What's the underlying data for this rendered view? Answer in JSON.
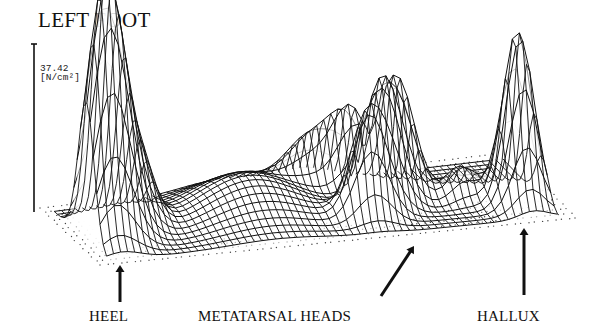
{
  "title": "LEFT FOOT",
  "axis": {
    "max_value": "37.42",
    "unit": "[N/cm²]"
  },
  "labels": {
    "heel": "HEEL",
    "metatarsal": "METATARSAL HEADS",
    "hallux": "HALLUX"
  },
  "chart_data": {
    "type": "surface-3d-wireframe",
    "title": "LEFT FOOT",
    "zlabel": "[N/cm²]",
    "zmax": 37.42,
    "grid": {
      "nu": 64,
      "nv": 16
    },
    "base_plane": {
      "back_left": [
        40,
        208
      ],
      "front_left": [
        100,
        265
      ],
      "front_right": [
        575,
        218
      ],
      "back_right": [
        512,
        152
      ]
    },
    "height_scale_px": 178,
    "peaks": [
      {
        "name": "heel-1",
        "u": 0.05,
        "v": 0.62,
        "amp": 1.0,
        "su": 0.035,
        "sv": 0.13
      },
      {
        "name": "heel-2",
        "u": 0.09,
        "v": 0.55,
        "amp": 0.8,
        "su": 0.035,
        "sv": 0.13
      },
      {
        "name": "heel-3",
        "u": 0.15,
        "v": 0.45,
        "amp": 0.35,
        "su": 0.03,
        "sv": 0.12
      },
      {
        "name": "midfoot",
        "u": 0.38,
        "v": 0.45,
        "amp": 0.22,
        "su": 0.1,
        "sv": 0.25
      },
      {
        "name": "mt-1",
        "u": 0.6,
        "v": 0.72,
        "amp": 0.55,
        "su": 0.035,
        "sv": 0.08
      },
      {
        "name": "mt-2",
        "u": 0.65,
        "v": 0.58,
        "amp": 0.65,
        "su": 0.035,
        "sv": 0.08
      },
      {
        "name": "mt-3",
        "u": 0.7,
        "v": 0.44,
        "amp": 0.62,
        "su": 0.035,
        "sv": 0.08
      },
      {
        "name": "mt-4",
        "u": 0.62,
        "v": 0.3,
        "amp": 0.4,
        "su": 0.035,
        "sv": 0.08
      },
      {
        "name": "mt-5",
        "u": 0.55,
        "v": 0.22,
        "amp": 0.3,
        "su": 0.05,
        "sv": 0.08
      },
      {
        "name": "lesser-toes",
        "u": 0.82,
        "v": 0.55,
        "amp": 0.18,
        "su": 0.03,
        "sv": 0.08
      },
      {
        "name": "hallux",
        "u": 0.92,
        "v": 0.7,
        "amp": 0.98,
        "su": 0.03,
        "sv": 0.1
      }
    ],
    "annotations": [
      {
        "label": "HEEL",
        "arrow_from": [
          120,
          302
        ],
        "arrow_to": [
          120,
          265
        ]
      },
      {
        "label": "METATARSAL HEADS",
        "arrow_from": [
          381,
          296
        ],
        "arrow_to": [
          414,
          246
        ]
      },
      {
        "label": "HALLUX",
        "arrow_from": [
          524,
          295
        ],
        "arrow_to": [
          524,
          228
        ]
      }
    ]
  }
}
